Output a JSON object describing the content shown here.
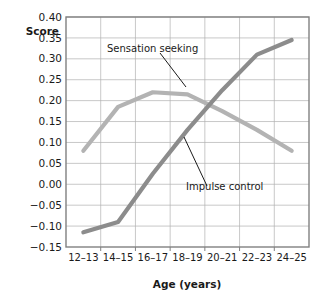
{
  "chart_data": {
    "type": "line",
    "title": "",
    "xlabel": "Age (years)",
    "ylabel": "Score",
    "categories": [
      "12–13",
      "14–15",
      "16–17",
      "18–19",
      "20–21",
      "22–23",
      "24–25"
    ],
    "ylim": [
      -0.15,
      0.4
    ],
    "ytick_labels": [
      "0.40",
      "0.35",
      "0.30",
      "0.25",
      "0.20",
      "0.15",
      "0.10",
      "0.05",
      "0.00",
      "−0.05",
      "−0.10",
      "−0.15"
    ],
    "ytick_values": [
      0.4,
      0.35,
      0.3,
      0.25,
      0.2,
      0.15,
      0.1,
      0.05,
      0.0,
      -0.05,
      -0.1,
      -0.15
    ],
    "grid": true,
    "legend_position": "inline-annotations",
    "series": [
      {
        "name": "Sensation seeking",
        "color": "#b3b3b3",
        "values": [
          0.08,
          0.185,
          0.22,
          0.215,
          0.175,
          0.13,
          0.08
        ]
      },
      {
        "name": "Impulse control",
        "color": "#8c8c8c",
        "values": [
          -0.115,
          -0.09,
          0.025,
          0.13,
          0.225,
          0.31,
          0.345
        ]
      }
    ],
    "annotations": [
      {
        "text": "Sensation seeking",
        "series": "Sensation seeking"
      },
      {
        "text": "Impulse control",
        "series": "Impulse control"
      }
    ]
  }
}
